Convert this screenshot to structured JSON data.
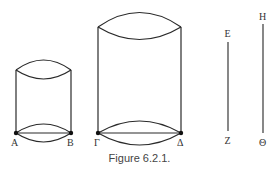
{
  "figure": {
    "caption": "Figure 6.2.1.",
    "cylinders": [
      {
        "name": "small",
        "points": [
          {
            "label": "A"
          },
          {
            "label": "B"
          }
        ]
      },
      {
        "name": "large",
        "points": [
          {
            "label": "Γ"
          },
          {
            "label": "Δ"
          }
        ]
      }
    ],
    "segments": [
      {
        "top": "E",
        "bottom": "Z"
      },
      {
        "top": "H",
        "bottom": "Θ"
      }
    ]
  }
}
